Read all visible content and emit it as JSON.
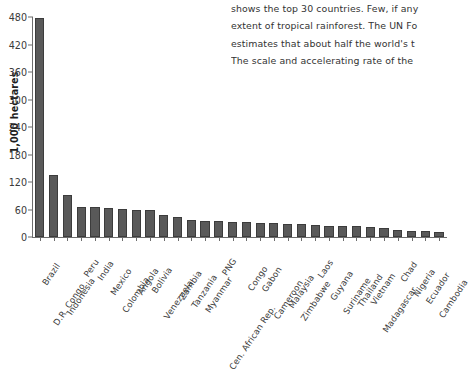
{
  "article": {
    "lines": [
      "shows the top 30 countries. Few, if any",
      "extent of tropical rainforest. The UN Fo",
      "estimates that about half the world's t",
      "The scale and accelerating rate of the"
    ]
  },
  "chart_data": {
    "type": "bar",
    "title": "",
    "xlabel": "",
    "ylabel": "1,000 hectares",
    "ylim": [
      0,
      480
    ],
    "yticks": [
      0,
      60,
      120,
      180,
      240,
      300,
      360,
      420,
      480
    ],
    "ytick_labels": [
      "0",
      "60",
      "120",
      "180",
      "240",
      "300",
      "360",
      "420",
      "480"
    ],
    "grid": false,
    "legend": null,
    "bar_color": "#595959",
    "bar_edge_color": "#3c3c3c",
    "axis_color": "#6d6d6d",
    "categories": [
      "Brazil",
      "D.R. Congo",
      "Indonesia",
      "Peru",
      "India",
      "Mexico",
      "Colombia",
      "Angola",
      "Bolivia",
      "Venezuela",
      "Zambia",
      "Tanzania",
      "Myanmar",
      "PNG",
      "Cen. African Rep.",
      "Congo",
      "Gabon",
      "Cameroon",
      "Malaysia",
      "Zimbabwe",
      "Laos",
      "Guyana",
      "Suriname",
      "Thailand",
      "Vietnam",
      "Madagascar",
      "Chad",
      "Nigeria",
      "Ecuador",
      "Cambodia"
    ],
    "values": [
      478,
      135,
      92,
      66,
      65,
      63,
      62,
      60,
      59,
      49,
      43,
      38,
      36,
      35,
      33,
      32,
      31,
      30,
      29,
      28,
      26,
      25,
      24,
      23,
      22,
      20,
      16,
      14,
      13,
      11
    ]
  }
}
